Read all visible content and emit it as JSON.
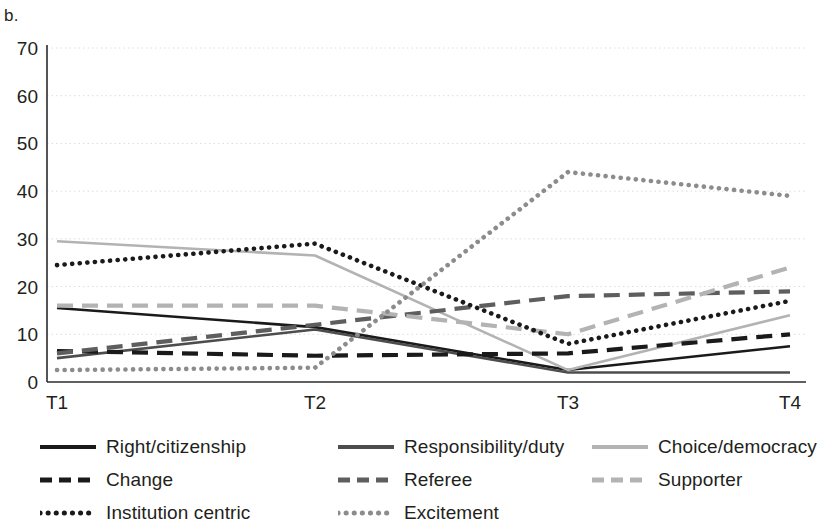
{
  "panel": {
    "label": "b."
  },
  "chart_data": {
    "type": "line",
    "title": "",
    "xlabel": "",
    "ylabel": "",
    "categories": [
      "T1",
      "T2",
      "T3",
      "T4"
    ],
    "ylim": [
      0,
      70
    ],
    "yticks": [
      0,
      10,
      20,
      30,
      40,
      50,
      60,
      70
    ],
    "grid": true,
    "legend_position": "bottom",
    "series": [
      {
        "name": "Right/citizenship",
        "values": [
          15.5,
          11.5,
          2.5,
          7.5
        ],
        "color": "#1a1a1a",
        "style": "solid",
        "swatch": "solid-black"
      },
      {
        "name": "Responsibility/duty",
        "values": [
          5,
          11,
          2,
          2
        ],
        "color": "#4d4d4d",
        "style": "solid",
        "swatch": "solid-darkgray"
      },
      {
        "name": "Choice/democracy",
        "values": [
          29.5,
          26.5,
          2.5,
          14
        ],
        "color": "#b3b3b3",
        "style": "solid",
        "swatch": "solid-lightgray"
      },
      {
        "name": "Change",
        "values": [
          6.5,
          5.5,
          6,
          10
        ],
        "color": "#1a1a1a",
        "style": "dashed",
        "swatch": "dashed-black"
      },
      {
        "name": "Referee",
        "values": [
          6,
          12,
          18,
          19
        ],
        "color": "#5e5e5e",
        "style": "dashed",
        "swatch": "dashed-darkgray"
      },
      {
        "name": "Supporter",
        "values": [
          16,
          16,
          10,
          24
        ],
        "color": "#b3b3b3",
        "style": "dashed",
        "swatch": "dashed-lightgray"
      },
      {
        "name": "Institution centric",
        "values": [
          24.5,
          29,
          8,
          17
        ],
        "color": "#1a1a1a",
        "style": "dotted",
        "swatch": "dotted-black"
      },
      {
        "name": "Excitement",
        "values": [
          2.5,
          3,
          44,
          39
        ],
        "color": "#8c8c8c",
        "style": "dotted",
        "swatch": "dotted-gray"
      }
    ]
  },
  "legend": {
    "columns": [
      [
        "Right/citizenship",
        "Change",
        "Institution centric"
      ],
      [
        "Responsibility/duty",
        "Referee",
        "Excitement"
      ],
      [
        "Choice/democracy",
        "Supporter"
      ]
    ]
  },
  "axis": {
    "y_tick_labels": [
      "70",
      "60",
      "50",
      "40",
      "30",
      "20",
      "10",
      "0"
    ],
    "x_tick_labels": [
      "T1",
      "T2",
      "T3",
      "T4"
    ]
  }
}
